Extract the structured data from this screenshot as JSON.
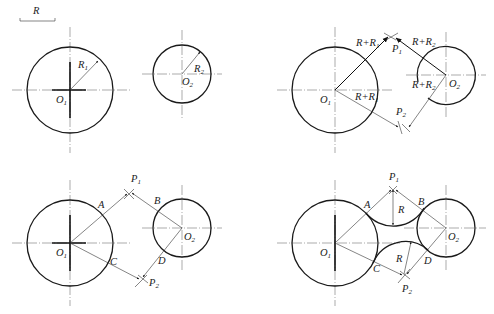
{
  "scale": {
    "label": "R"
  },
  "panels": [
    {
      "id": "given",
      "labels": {
        "O1": "O",
        "O1_sub": "1",
        "O2": "O",
        "O2_sub": "2",
        "R1": "R",
        "R1_sub": "1",
        "R2": "R",
        "R2_sub": "2"
      }
    },
    {
      "id": "find-centers",
      "labels": {
        "O1": "O",
        "O1_sub": "1",
        "O2": "O",
        "O2_sub": "2",
        "P1": "P",
        "P1_sub": "1",
        "P2": "P",
        "P2_sub": "2",
        "r1_top": "R+R",
        "r1_top_sub": "1",
        "r1_bot": "R+R",
        "r1_bot_sub": "1",
        "r2_top": "R+R",
        "r2_top_sub": "2",
        "r2_bot": "R+R",
        "r2_bot_sub": "2"
      }
    },
    {
      "id": "tangent-points",
      "labels": {
        "O1": "O",
        "O1_sub": "1",
        "O2": "O",
        "O2_sub": "2",
        "P1": "P",
        "P1_sub": "1",
        "P2": "P",
        "P2_sub": "2",
        "A": "A",
        "B": "B",
        "C": "C",
        "D": "D"
      }
    },
    {
      "id": "draw-arcs",
      "labels": {
        "O1": "O",
        "O1_sub": "1",
        "O2": "O",
        "O2_sub": "2",
        "P1": "P",
        "P1_sub": "1",
        "P2": "P",
        "P2_sub": "2",
        "A": "A",
        "B": "B",
        "C": "C",
        "D": "D",
        "R_top": "R",
        "R_bot": "R"
      }
    }
  ]
}
